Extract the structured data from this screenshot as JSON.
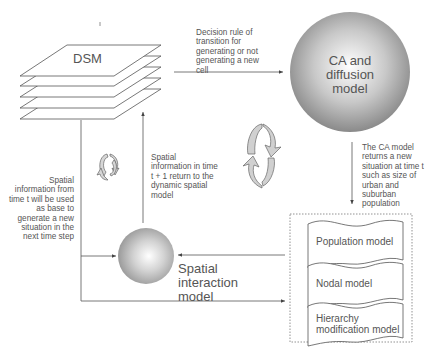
{
  "nodes": {
    "dsm": {
      "label": "DSM"
    },
    "ca_model": {
      "label_lines": [
        "CA and",
        "diffusion",
        "model"
      ]
    },
    "spatial_interaction": {
      "label_lines": [
        "Spatial",
        "interaction",
        "model"
      ]
    },
    "models_group": {
      "items": [
        {
          "label": "Population model"
        },
        {
          "label": "Nodal model"
        },
        {
          "label_lines": [
            "Hierarchy",
            "modification model"
          ]
        }
      ]
    }
  },
  "edges": {
    "dsm_to_ca": {
      "label_lines": [
        "Decision rule of",
        "transition for",
        "generating or not",
        "generating a new",
        "cell"
      ]
    },
    "ca_to_models": {
      "label_lines": [
        "The CA model",
        "returns a new",
        "situation at time t",
        "such as size of",
        "urban and",
        "suburban",
        "population"
      ]
    },
    "dsm_to_spatial": {
      "label_lines": [
        "Spatial",
        "information from",
        "time t will be used",
        "as base to",
        "generate a new",
        "situation in the",
        "next time step"
      ]
    },
    "spatial_to_dsm": {
      "label_lines": [
        "Spatial",
        "information in time",
        "t + 1 return to the",
        "dynamic spatial",
        "model"
      ]
    }
  },
  "icons": [
    "cycle-icon-small",
    "cycle-icon-large"
  ],
  "colors": {
    "line": "#555555",
    "sphere_light": "#ffffff",
    "sphere_dark": "#8a8a8a",
    "cycle_fill": "#cfcfcf"
  }
}
